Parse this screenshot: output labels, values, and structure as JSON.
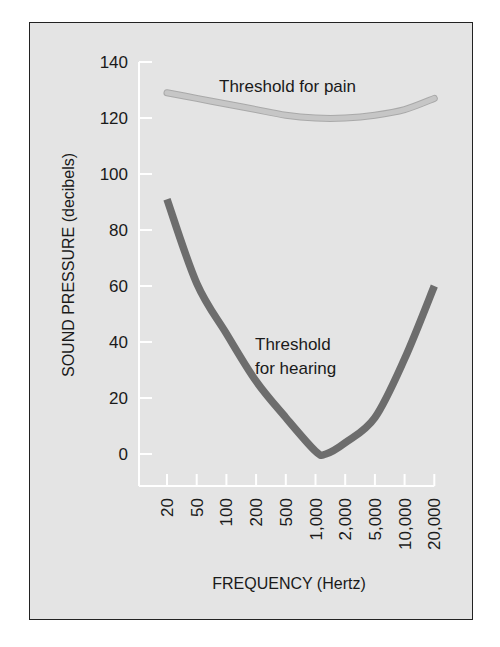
{
  "chart_data": {
    "type": "line",
    "title": "",
    "xlabel": "FREQUENCY (Hertz)",
    "ylabel": "SOUND PRESSURE (decibels)",
    "x_scale": "log",
    "x_tick_labels": [
      "20",
      "50",
      "100",
      "200",
      "500",
      "1,000",
      "2,000",
      "5,000",
      "10,000",
      "20,000"
    ],
    "x": [
      20,
      50,
      100,
      200,
      500,
      1000,
      2000,
      5000,
      10000,
      20000
    ],
    "y_tick_labels": [
      "0",
      "20",
      "40",
      "60",
      "80",
      "100",
      "120",
      "140"
    ],
    "ylim": [
      0,
      140
    ],
    "grid": false,
    "legend": "none (curves labeled inline)",
    "series": [
      {
        "name": "Threshold for pain",
        "label_lines": [
          "Threshold for pain"
        ],
        "color": "#c6c6c6",
        "values": [
          129,
          127,
          125,
          123,
          121,
          120,
          120,
          121,
          123,
          127
        ]
      },
      {
        "name": "Threshold for hearing",
        "label_lines": [
          "Threshold",
          "for hearing"
        ],
        "color": "#6d6d6d",
        "values": [
          91,
          61,
          43,
          26,
          13,
          1,
          4,
          13,
          34,
          60
        ]
      }
    ],
    "annotations": [
      {
        "text": "Threshold for pain",
        "near": "top curve"
      },
      {
        "text": "Threshold for hearing",
        "near": "bottom U-shaped curve"
      }
    ]
  },
  "colors": {
    "panel_background": "#e4e4e4",
    "axis": "#ffffff",
    "frame": "#222222",
    "pain_curve": "#c6c6c6",
    "hearing_curve": "#6d6d6d"
  }
}
